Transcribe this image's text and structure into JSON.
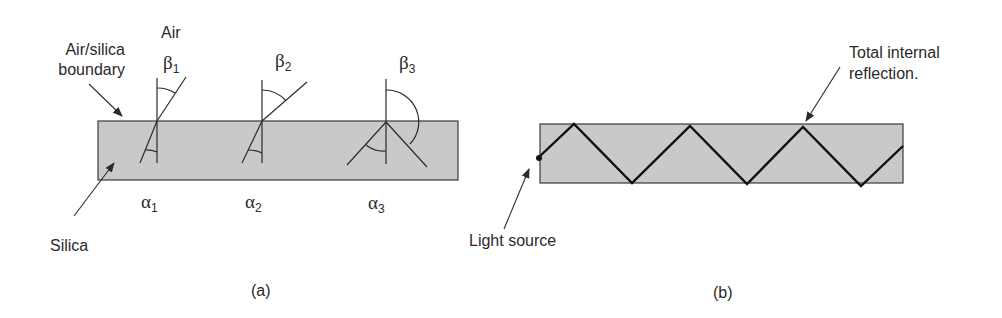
{
  "panel_a": {
    "caption": "(a)",
    "labels": {
      "air": "Air",
      "boundary_line1": "Air/silica",
      "boundary_line2": "boundary",
      "silica": "Silica"
    },
    "angles": [
      {
        "beta": "β",
        "beta_sub": "1",
        "alpha": "α",
        "alpha_sub": "1"
      },
      {
        "beta": "β",
        "beta_sub": "2",
        "alpha": "α",
        "alpha_sub": "2"
      },
      {
        "beta": "β",
        "beta_sub": "3",
        "alpha": "α",
        "alpha_sub": "3"
      }
    ]
  },
  "panel_b": {
    "caption": "(b)",
    "labels": {
      "light_source": "Light source",
      "tir_line1": "Total internal",
      "tir_line2": "reflection."
    }
  },
  "colors": {
    "fill": "#c9c9c9",
    "stroke": "#2b2b2b",
    "ray": "#1a1a1a"
  }
}
